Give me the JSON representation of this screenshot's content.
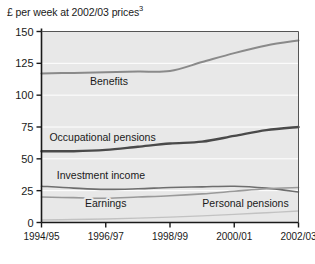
{
  "chart": {
    "axis_title": "£ per week at 2002/03 prices",
    "axis_title_superscript": "3"
  },
  "chart_data": {
    "type": "line",
    "xlabel": "",
    "ylabel": "£ per week at 2002/03 prices",
    "ylim": [
      0,
      150
    ],
    "yticks": [
      0,
      25,
      50,
      75,
      100,
      125,
      150
    ],
    "ytick_labels": [
      "0",
      "25",
      "50",
      "75",
      "100",
      "125",
      "150"
    ],
    "grid": true,
    "legend": "inline-labels",
    "x": [
      "1994/95",
      "1995/96",
      "1996/97",
      "1997/98",
      "1998/99",
      "1999/00",
      "2000/01",
      "2001/02",
      "2002/03"
    ],
    "xtick_labels": [
      "1994/95",
      "1996/97",
      "1998/99",
      "2000/01",
      "2002/03"
    ],
    "series": [
      {
        "name": "Benefits",
        "color": "#8a8a8a",
        "width": 2.0,
        "values": [
          117,
          117.5,
          118,
          118.5,
          119,
          126,
          133,
          139,
          143
        ],
        "label_x_index": 2.1,
        "label_y": 111
      },
      {
        "name": "Occupational pensions",
        "color": "#4a4a4a",
        "width": 2.4,
        "values": [
          56,
          56,
          57,
          59.5,
          62,
          63.5,
          68,
          72.5,
          75
        ],
        "label_x_index": 1.9,
        "label_y": 67
      },
      {
        "name": "Investment income",
        "color": "#6e6e6e",
        "width": 1.6,
        "values": [
          28.5,
          27,
          26,
          26.5,
          27.5,
          28,
          28.5,
          27,
          24
        ],
        "label_x_index": 1.85,
        "label_y": 37
      },
      {
        "name": "Earnings",
        "color": "#9a9a9a",
        "width": 1.6,
        "values": [
          20,
          19.5,
          19,
          20,
          21,
          22.5,
          24.5,
          26.5,
          27.5
        ],
        "label_x_index": 2.0,
        "label_y": 15
      },
      {
        "name": "Personal pensions",
        "color": "#c2c2c2",
        "width": 1.4,
        "values": [
          2,
          2.3,
          2.8,
          3.4,
          4.2,
          5.2,
          6.4,
          7.7,
          9
        ],
        "label_x_index": 6.35,
        "label_y": 15
      }
    ]
  }
}
